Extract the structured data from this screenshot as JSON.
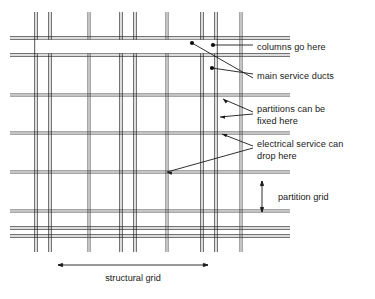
{
  "diagram": {
    "background_color": "#ffffff",
    "line_color": "#3c3c3c",
    "heavy_line_color": "#1a1a1a",
    "leader_color": "#1a1a1a",
    "text_color": "#1a1a1a",
    "annotations": [
      {
        "id": "columns",
        "label": "columns go here",
        "x": 257,
        "y": 47,
        "marker_dots": [
          {
            "x": 192,
            "y": 43
          },
          {
            "x": 213,
            "y": 45
          }
        ]
      },
      {
        "id": "ducts",
        "label": "main service ducts",
        "x": 257,
        "y": 76,
        "marker_dots": [
          {
            "x": 212,
            "y": 68
          }
        ]
      },
      {
        "id": "partitions",
        "label_line1": "partitions can be",
        "label_line2": "fixed here",
        "x": 257,
        "y": 112
      },
      {
        "id": "electrical",
        "label_line1": "electrical service can",
        "label_line2": "drop here",
        "x": 257,
        "y": 147
      }
    ],
    "dimensions": [
      {
        "id": "partition-grid",
        "label": "partition grid",
        "orientation": "vertical",
        "x": 262,
        "y1": 181,
        "y2": 212,
        "label_x": 278,
        "label_y": 200
      },
      {
        "id": "structural-grid",
        "label": "structural grid",
        "orientation": "horizontal",
        "y": 265,
        "x1": 58,
        "x2": 208,
        "label_x": 133,
        "label_y": 281
      }
    ],
    "grid": {
      "vertical_structural": [
        36,
        50,
        121,
        135,
        202,
        216
      ],
      "vertical_partition": [
        89,
        167,
        241
      ],
      "vertical_extent": {
        "top": 12,
        "bottom": 252
      },
      "horizontal_structural": [
        38,
        55,
        228,
        236
      ],
      "horizontal_partition": [
        95,
        133,
        172,
        211
      ],
      "horizontal_extent": {
        "left": 10,
        "right": 290
      },
      "duct_band": {
        "y1": 38,
        "y2": 55,
        "x1": 36,
        "x2": 216
      }
    }
  }
}
